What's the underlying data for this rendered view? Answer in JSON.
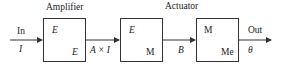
{
  "diagram": {
    "type": "block-diagram",
    "titles": {
      "amplifier": "Amplifier",
      "actuator": "Actuator"
    },
    "input": {
      "top": "In",
      "bottom": "I"
    },
    "output": {
      "top": "Out",
      "bottom": "θ"
    },
    "blocks": [
      {
        "name": "amplifier",
        "top_left": "E",
        "bottom_right": "E"
      },
      {
        "name": "actuator-electrical",
        "top_left": "E",
        "bottom_right": "M"
      },
      {
        "name": "actuator-mechanical",
        "top_left": "M",
        "bottom_right": "Me"
      }
    ],
    "signals": [
      {
        "from": "amplifier",
        "to": "actuator-electrical",
        "label": "A × I"
      },
      {
        "from": "actuator-electrical",
        "to": "actuator-mechanical",
        "label": "B"
      }
    ],
    "colors": {
      "line": "#333333",
      "text": "#222222",
      "background": "#ffffff"
    }
  }
}
